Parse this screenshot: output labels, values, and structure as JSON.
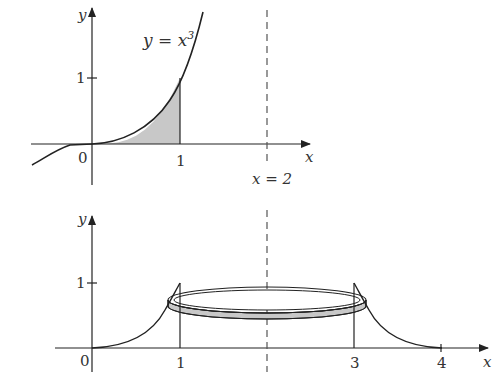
{
  "top_plot": {
    "y_axis_label": "y",
    "x_axis_label": "x",
    "origin_label": "0",
    "y_tick_label": "1",
    "x_tick_label": "1",
    "curve_label_lhs": "y = x",
    "curve_label_exp": "3",
    "asymptote_label": "x = 2",
    "shaded_region": "area under y = x^3 from x = 0 to x = 1"
  },
  "bottom_plot": {
    "y_axis_label": "y",
    "x_axis_label": "x",
    "origin_label": "0",
    "y_tick_label": "1",
    "x_tick_labels": [
      "1",
      "3",
      "4"
    ],
    "solid": "cylindrical shell rotated about x = 2"
  },
  "colors": {
    "ink": "#222222",
    "shade": "#c8c8c8",
    "dash": "#555555"
  }
}
